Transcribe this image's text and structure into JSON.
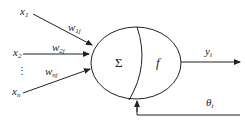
{
  "diagram": {
    "inputs": [
      {
        "label": "x",
        "sub": "1"
      },
      {
        "label": "x",
        "sub": "2"
      },
      {
        "label": "⋮",
        "sub": ""
      },
      {
        "label": "x",
        "sub": "n"
      }
    ],
    "weights": [
      {
        "label": "w",
        "sub": "1j"
      },
      {
        "label": "w",
        "sub": "2j"
      },
      {
        "label": "w",
        "sub": "nj"
      }
    ],
    "summation": "Σ",
    "activation": "f",
    "output": {
      "label": "y",
      "sub": "i"
    },
    "threshold": {
      "label": "θ",
      "sub": "i"
    },
    "colors": {
      "stroke": "#222222",
      "background": "#ffffff"
    }
  }
}
